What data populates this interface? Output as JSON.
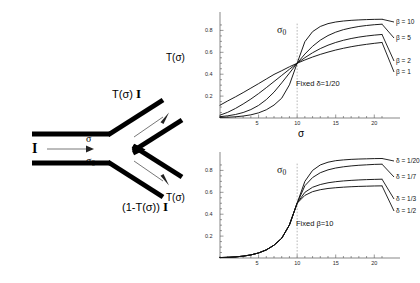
{
  "figure": {
    "diagram": {
      "name": "y-junction-beam-splitter",
      "input_label": "I",
      "branch_upper_label": "σ",
      "branch_lower_label": "σ0",
      "output_upper_label": "T(σ)",
      "output_upper_unit": "I",
      "output_lower_label": "(1-T(σ))",
      "output_lower_unit": "I"
    }
  },
  "chart_data": [
    {
      "id": "top-chart",
      "type": "line",
      "title": "",
      "xlabel": "σ",
      "ylabel": "T(σ)",
      "xlim": [
        0,
        21
      ],
      "ylim": [
        0,
        0.95
      ],
      "xticks": [
        5,
        10,
        15,
        20
      ],
      "yticks": [
        0.2,
        0.4,
        0.6,
        0.8
      ],
      "xtick_labels": [
        "5",
        "10",
        "15",
        "20"
      ],
      "ytick_labels": [
        "0.2",
        "0.4",
        "0.6",
        "0.8"
      ],
      "grid": false,
      "annotation": "Fixed δ=1/20",
      "marker_label": "σ0",
      "marker_x": 10,
      "legend_position": "right",
      "x": [
        0,
        1,
        2,
        3,
        4,
        5,
        6,
        7,
        8,
        9,
        10,
        11,
        12,
        13,
        14,
        15,
        16,
        17,
        18,
        19,
        20,
        21
      ],
      "series": [
        {
          "name": "β = 10",
          "values": [
            0.005,
            0.007,
            0.011,
            0.018,
            0.029,
            0.047,
            0.075,
            0.118,
            0.181,
            0.303,
            0.5,
            0.697,
            0.789,
            0.836,
            0.862,
            0.877,
            0.886,
            0.892,
            0.896,
            0.899,
            0.901,
            0.902
          ]
        },
        {
          "name": "β = 5",
          "values": [
            0.012,
            0.02,
            0.032,
            0.05,
            0.077,
            0.115,
            0.168,
            0.236,
            0.321,
            0.41,
            0.5,
            0.584,
            0.655,
            0.711,
            0.753,
            0.784,
            0.807,
            0.823,
            0.836,
            0.845,
            0.852,
            0.857
          ]
        },
        {
          "name": "β = 2",
          "values": [
            0.026,
            0.052,
            0.087,
            0.128,
            0.173,
            0.223,
            0.277,
            0.333,
            0.389,
            0.445,
            0.5,
            0.551,
            0.596,
            0.634,
            0.665,
            0.69,
            0.71,
            0.726,
            0.739,
            0.749,
            0.757,
            0.763
          ]
        },
        {
          "name": "β = 1",
          "values": [
            0.117,
            0.156,
            0.193,
            0.232,
            0.273,
            0.314,
            0.356,
            0.398,
            0.432,
            0.468,
            0.5,
            0.53,
            0.557,
            0.581,
            0.602,
            0.621,
            0.637,
            0.651,
            0.663,
            0.673,
            0.682,
            0.69
          ]
        }
      ]
    },
    {
      "id": "bottom-chart",
      "type": "line",
      "title": "",
      "xlabel": "σ",
      "ylabel": "T(σ)",
      "xlim": [
        0,
        21
      ],
      "ylim": [
        0,
        0.95
      ],
      "xticks": [
        5,
        10,
        15,
        20
      ],
      "yticks": [
        0.2,
        0.4,
        0.6,
        0.8
      ],
      "xtick_labels": [
        "5",
        "10",
        "15",
        "20"
      ],
      "ytick_labels": [
        "0.2",
        "0.4",
        "0.6",
        "0.8"
      ],
      "grid": false,
      "annotation": "Fixed β=10",
      "marker_label": "σ0",
      "marker_x": 10,
      "legend_position": "right",
      "x": [
        0,
        1,
        2,
        3,
        4,
        5,
        6,
        7,
        8,
        9,
        10,
        11,
        12,
        13,
        14,
        15,
        16,
        17,
        18,
        19,
        20,
        21
      ],
      "series": [
        {
          "name": "δ = 1/20",
          "values": [
            0.004,
            0.006,
            0.01,
            0.017,
            0.028,
            0.046,
            0.074,
            0.117,
            0.18,
            0.302,
            0.5,
            0.7,
            0.8,
            0.85,
            0.875,
            0.889,
            0.896,
            0.901,
            0.904,
            0.906,
            0.908,
            0.909
          ]
        },
        {
          "name": "δ = 1/7",
          "values": [
            0.004,
            0.006,
            0.01,
            0.017,
            0.028,
            0.046,
            0.074,
            0.117,
            0.18,
            0.302,
            0.5,
            0.66,
            0.735,
            0.779,
            0.805,
            0.822,
            0.833,
            0.841,
            0.847,
            0.851,
            0.855,
            0.857
          ]
        },
        {
          "name": "δ = 1/3",
          "values": [
            0.004,
            0.006,
            0.01,
            0.017,
            0.028,
            0.046,
            0.074,
            0.117,
            0.18,
            0.302,
            0.5,
            0.6,
            0.646,
            0.671,
            0.687,
            0.697,
            0.704,
            0.709,
            0.713,
            0.716,
            0.718,
            0.72
          ]
        },
        {
          "name": "δ = 1/2",
          "values": [
            0.004,
            0.006,
            0.01,
            0.017,
            0.028,
            0.046,
            0.074,
            0.117,
            0.18,
            0.302,
            0.5,
            0.572,
            0.606,
            0.624,
            0.635,
            0.642,
            0.647,
            0.651,
            0.654,
            0.656,
            0.658,
            0.659
          ]
        }
      ]
    }
  ]
}
